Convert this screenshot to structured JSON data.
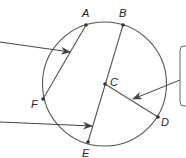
{
  "diagram": {
    "type": "circle-geometry",
    "circle": {
      "cx": 104.5,
      "cy": 84,
      "r": 62,
      "stroke": "#555555"
    },
    "points": [
      {
        "id": "A",
        "label": "A",
        "x": 86,
        "y": 25,
        "lx": 82,
        "ly": 17
      },
      {
        "id": "B",
        "label": "B",
        "x": 123,
        "y": 25,
        "lx": 119,
        "ly": 17
      },
      {
        "id": "C",
        "label": "C",
        "x": 105,
        "y": 84,
        "lx": 110,
        "ly": 86
      },
      {
        "id": "D",
        "label": "D",
        "x": 158,
        "y": 117,
        "lx": 161,
        "ly": 126
      },
      {
        "id": "E",
        "label": "E",
        "x": 88,
        "y": 142,
        "lx": 82,
        "ly": 157
      },
      {
        "id": "F",
        "label": "F",
        "x": 43,
        "y": 99,
        "lx": 31,
        "ly": 108
      }
    ],
    "segments": [
      {
        "name": "chord-AF",
        "from": "A",
        "to": "F"
      },
      {
        "name": "diameter-BE",
        "from": "B",
        "to": "E"
      },
      {
        "name": "radius-CD",
        "from": "C",
        "to": "D"
      }
    ],
    "arrows": [
      {
        "name": "arrow-to-chord-AF",
        "x1": 0,
        "y1": 42,
        "x2": 70,
        "y2": 52
      },
      {
        "name": "arrow-to-diameter-BE",
        "x1": 0,
        "y1": 122,
        "x2": 92,
        "y2": 126
      },
      {
        "name": "arrow-to-radius-CD",
        "x1": 180,
        "y1": 80,
        "x2": 133,
        "y2": 99
      }
    ],
    "callout_box": {
      "x": 180,
      "y": 46,
      "width": 20,
      "height": 60,
      "text": ""
    },
    "colors": {
      "line": "#555555",
      "point": "#333333",
      "box": "#666666"
    }
  }
}
